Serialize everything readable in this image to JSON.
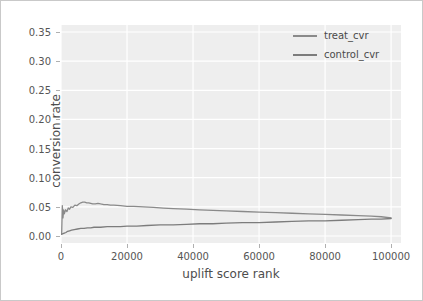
{
  "chart_data": {
    "type": "line",
    "title": "",
    "xlabel": "uplift score rank",
    "ylabel": "conversion rate",
    "xlim": [
      0,
      103000
    ],
    "ylim": [
      -0.012,
      0.362
    ],
    "xticks": [
      0,
      20000,
      40000,
      60000,
      80000,
      100000
    ],
    "xticklabels": [
      "0",
      "20000",
      "40000",
      "60000",
      "80000",
      "100000"
    ],
    "yticks": [
      0.0,
      0.05,
      0.1,
      0.15,
      0.2,
      0.25,
      0.3,
      0.35
    ],
    "yticklabels": [
      "0.00",
      "0.05",
      "0.10",
      "0.15",
      "0.20",
      "0.25",
      "0.30",
      "0.35"
    ],
    "grid": true,
    "grid_color": "#ffffff",
    "panel_color": "#eeeeee",
    "legend_position": "upper right",
    "legend_frame": false,
    "series": [
      {
        "name": "treat_cvr",
        "color": "#8a8a8a",
        "x": [
          200,
          400,
          600,
          800,
          1000,
          1400,
          1800,
          2200,
          2600,
          3000,
          3600,
          4200,
          4800,
          5400,
          6000,
          6600,
          7200,
          7800,
          8400,
          9000,
          9600,
          10400,
          11200,
          12000,
          13000,
          14000,
          15000,
          16000,
          18000,
          20000,
          22000,
          25000,
          28000,
          31000,
          34000,
          38000,
          42000,
          46000,
          50000,
          55000,
          60000,
          65000,
          70000,
          75000,
          80000,
          85000,
          90000,
          94000,
          97000,
          100000
        ],
        "y": [
          0.003,
          0.052,
          0.031,
          0.045,
          0.038,
          0.045,
          0.042,
          0.048,
          0.046,
          0.05,
          0.049,
          0.053,
          0.052,
          0.055,
          0.057,
          0.058,
          0.058,
          0.057,
          0.057,
          0.056,
          0.055,
          0.055,
          0.056,
          0.055,
          0.054,
          0.054,
          0.053,
          0.053,
          0.052,
          0.051,
          0.051,
          0.05,
          0.049,
          0.048,
          0.047,
          0.046,
          0.045,
          0.044,
          0.043,
          0.042,
          0.041,
          0.04,
          0.039,
          0.038,
          0.037,
          0.036,
          0.035,
          0.034,
          0.033,
          0.031
        ]
      },
      {
        "name": "control_cvr",
        "color": "#7c7c7c",
        "x": [
          200,
          600,
          1000,
          1500,
          2000,
          2600,
          3200,
          4000,
          5000,
          6000,
          7000,
          8000,
          9000,
          10000,
          11000,
          12000,
          14000,
          16000,
          18000,
          20000,
          23000,
          26000,
          30000,
          34000,
          38000,
          42000,
          46000,
          50000,
          55000,
          60000,
          65000,
          70000,
          75000,
          80000,
          85000,
          90000,
          94000,
          97000,
          100000
        ],
        "y": [
          0.003,
          0.004,
          0.005,
          0.006,
          0.008,
          0.009,
          0.01,
          0.011,
          0.012,
          0.013,
          0.013,
          0.014,
          0.014,
          0.015,
          0.015,
          0.015,
          0.016,
          0.016,
          0.016,
          0.017,
          0.017,
          0.018,
          0.019,
          0.019,
          0.02,
          0.021,
          0.021,
          0.022,
          0.023,
          0.023,
          0.024,
          0.025,
          0.026,
          0.026,
          0.027,
          0.028,
          0.029,
          0.029,
          0.03
        ]
      }
    ]
  }
}
